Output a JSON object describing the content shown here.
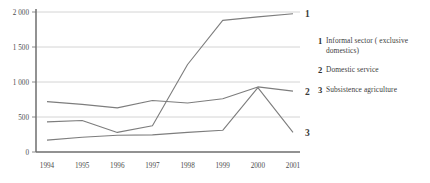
{
  "chart_data": {
    "type": "line",
    "title": "",
    "xlabel": "",
    "ylabel": "",
    "categories": [
      "1994",
      "1995",
      "1996",
      "1997",
      "1998",
      "1999",
      "2000",
      "2001"
    ],
    "ylim": [
      0,
      2000
    ],
    "yticks": [
      0,
      500,
      1000,
      1500,
      2000
    ],
    "ytick_labels": [
      "0",
      "500",
      "1 000",
      "1 500",
      "2 000"
    ],
    "grid": true,
    "legend_position": "right",
    "series": [
      {
        "key": "1",
        "name": "Informal sector ( exclusive domestics)",
        "values": [
          430,
          450,
          280,
          375,
          1250,
          1880,
          1930,
          1975
        ],
        "color": "#7d7d7d"
      },
      {
        "key": "2",
        "name": "Domestic service",
        "values": [
          720,
          680,
          630,
          735,
          700,
          760,
          930,
          870
        ],
        "color": "#7d7d7d"
      },
      {
        "key": "3",
        "name": "Subsistence agriculture",
        "values": [
          170,
          210,
          240,
          245,
          280,
          310,
          920,
          280
        ],
        "color": "#7d7d7d"
      }
    ]
  },
  "axis": {
    "y_labels": [
      "2 000",
      "1 500",
      "1 000",
      "500",
      "0"
    ],
    "x_labels": [
      "1994",
      "1995",
      "1996",
      "1997",
      "1998",
      "1999",
      "2000",
      "2001"
    ]
  },
  "end_labels": {
    "series1": "1",
    "series2": "2",
    "series3": "3"
  },
  "legend": {
    "items": [
      {
        "num": "1",
        "label": "Informal sector ( exclusive domestics)"
      },
      {
        "num": "2",
        "label": "Domestic service"
      },
      {
        "num": "3",
        "label": "Subsistence agriculture"
      }
    ]
  },
  "colors": {
    "line": "#7d7d7d",
    "axis": "#6e6e6e",
    "grid": "#c9c9c9",
    "text": "#3d3d3d"
  }
}
